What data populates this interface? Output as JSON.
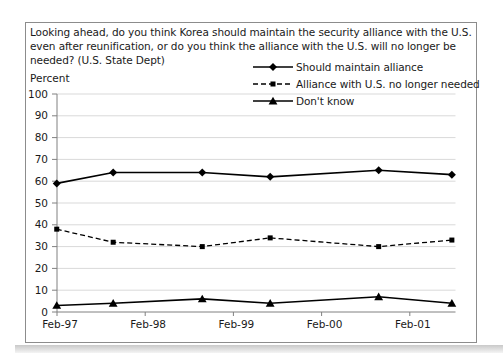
{
  "chart_data": {
    "type": "line",
    "title_lines": [
      "Looking ahead, do you think Korea should maintain the security alliance with the U.S.",
      "even after reunification, or do you think the alliance with the U.S. will no longer be",
      "needed? (U.S. State Dept)"
    ],
    "y_axis": {
      "label": "Percent",
      "min": 0,
      "max": 100,
      "tick_step": 10,
      "ticks": [
        0,
        10,
        20,
        30,
        40,
        50,
        60,
        70,
        80,
        90,
        100
      ]
    },
    "x_axis": {
      "tick_labels": [
        "Feb-97",
        "Feb-98",
        "Feb-99",
        "Feb-00",
        "Feb-01"
      ],
      "tick_years": [
        1997.083,
        1998.083,
        1999.083,
        2000.083,
        2001.083
      ],
      "range_years": [
        1997.05,
        2001.6
      ]
    },
    "x_years": [
      1997.08,
      1997.72,
      1998.73,
      1999.5,
      2000.73,
      2001.56
    ],
    "series": [
      {
        "name": "Should maintain alliance",
        "line": "solid",
        "marker": "diamond",
        "values": [
          59,
          64,
          64,
          62,
          65,
          63
        ]
      },
      {
        "name": "Alliance with U.S. no longer needed",
        "line": "dashed",
        "marker": "square",
        "values": [
          38,
          32,
          30,
          34,
          30,
          33
        ]
      },
      {
        "name": "Don't know",
        "line": "solid",
        "marker": "triangle",
        "values": [
          3,
          4,
          6,
          4,
          7,
          4
        ]
      }
    ],
    "legend_position": "top-right",
    "grid": "horizontal",
    "colors": {
      "series": "#000000",
      "gridline": "#d9d9d9",
      "axis": "#808080",
      "text": "#1a1a1a",
      "background": "#ffffff",
      "border": "#8c8c8c"
    }
  }
}
